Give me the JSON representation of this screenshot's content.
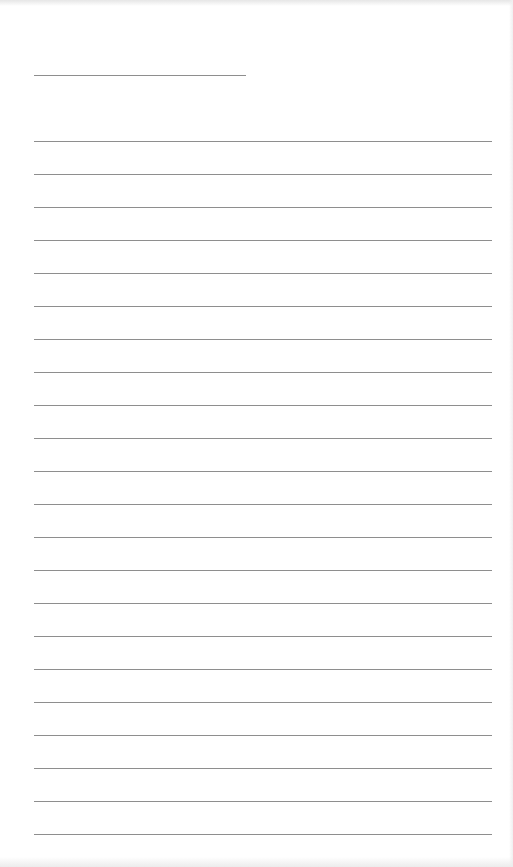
{
  "page": {
    "type": "lined-paper",
    "background": "#ffffff",
    "line_color": "#8e8e8e",
    "header_line": {
      "x": 34,
      "y": 75,
      "width": 212
    },
    "body_lines": {
      "count": 22,
      "x": 34,
      "width": 458,
      "first_y": 141,
      "spacing": 33
    }
  }
}
